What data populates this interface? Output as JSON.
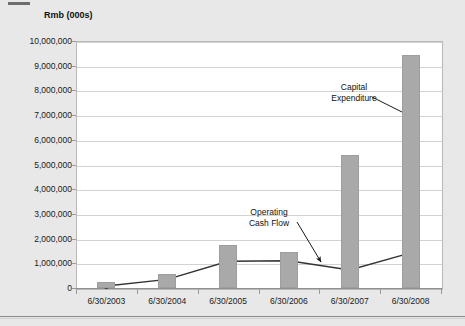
{
  "chart_data": {
    "type": "bar",
    "title": "",
    "ylabel": "Rmb (000s)",
    "xlabel": "",
    "categories": [
      "6/30/2003",
      "6/30/2004",
      "6/30/2005",
      "6/30/2006",
      "6/30/2007",
      "6/30/2008"
    ],
    "ylim": [
      0,
      10000000
    ],
    "ytick_labels": [
      "10,000,000",
      "9,000,000",
      "8,000,000",
      "7,000,000",
      "6,000,000",
      "5,000,000",
      "4,000,000",
      "3,000,000",
      "2,000,000",
      "1,000,000",
      "0"
    ],
    "ytick_values": [
      10000000,
      9000000,
      8000000,
      7000000,
      6000000,
      5000000,
      4000000,
      3000000,
      2000000,
      1000000,
      0
    ],
    "grid": true,
    "legend": "none",
    "series": [
      {
        "name": "Capital Expenditure",
        "type": "bar",
        "color": "#a9a9a9",
        "values": [
          250000,
          560000,
          1750000,
          1450000,
          5400000,
          9450000
        ]
      },
      {
        "name": "Operating Cash Flow",
        "type": "line",
        "color": "#333333",
        "values": [
          80000,
          350000,
          1080000,
          1100000,
          730000,
          1420000
        ]
      }
    ],
    "annotations": [
      {
        "id": "capital-expenditure",
        "label_line1": "Capital",
        "label_line2": "Expenditure"
      },
      {
        "id": "operating-cash-flow",
        "label_line1": "Operating",
        "label_line2": "Cash Flow"
      }
    ]
  }
}
